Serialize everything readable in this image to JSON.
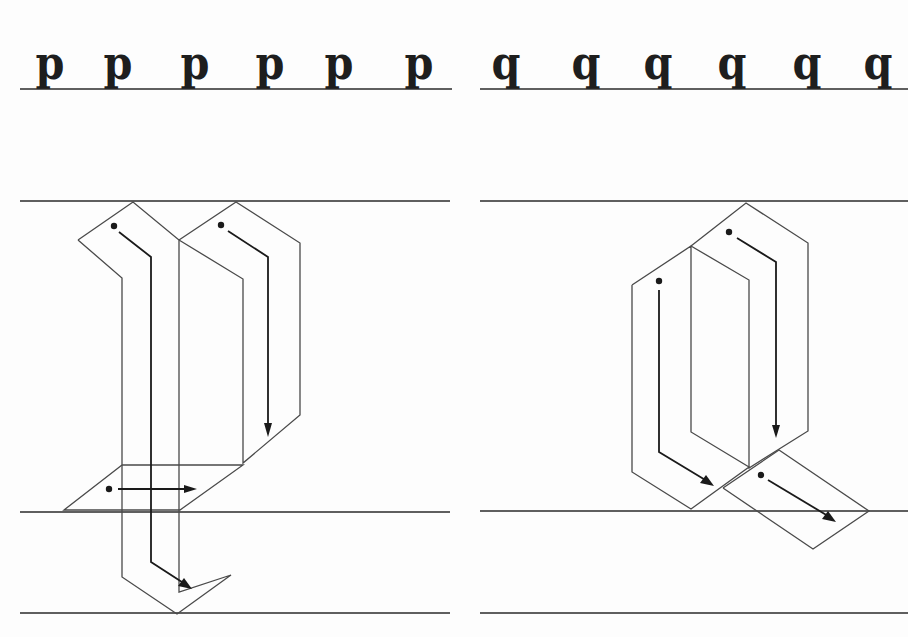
{
  "page": {
    "background": "#fdfdfd",
    "ink_color": "#1e1e1e"
  },
  "left_panel": {
    "letter": "p",
    "sample_row": [
      "p",
      "p",
      "p",
      "p",
      "p",
      "p"
    ],
    "sample_x": [
      46,
      113,
      190,
      265,
      334,
      414
    ],
    "strokes": [
      {
        "id": 1,
        "description": "left stem: diagonal entry then vertical descent into descender with diagonal exit",
        "direction": "down"
      },
      {
        "id": 2,
        "description": "right bowl stroke: diagonal entry then vertical descent",
        "direction": "down"
      },
      {
        "id": 3,
        "description": "base hairline/foot stroke",
        "direction": "right"
      }
    ]
  },
  "right_panel": {
    "letter": "q",
    "sample_row": [
      "q",
      "q",
      "q",
      "q",
      "q",
      "q"
    ],
    "sample_x": [
      502,
      582,
      654,
      728,
      803,
      874
    ],
    "strokes": [
      {
        "id": 1,
        "description": "left bowl stroke: vertical descent then diagonal exit",
        "direction": "down"
      },
      {
        "id": 2,
        "description": "right stem stroke: diagonal entry then vertical descent",
        "direction": "down"
      },
      {
        "id": 3,
        "description": "tail stroke",
        "direction": "diagonal-down-right"
      }
    ]
  },
  "guidelines_y": {
    "sample_baseline": 89,
    "waistline": 201,
    "baseline": 512,
    "descender_line": 613
  }
}
